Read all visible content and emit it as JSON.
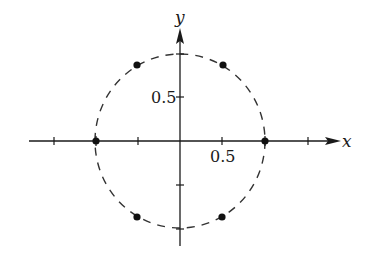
{
  "figure": {
    "type": "diagram",
    "axes": {
      "x_label": "x",
      "y_label": "y",
      "x_tick_label": "0.5",
      "y_tick_label": "0.5"
    },
    "circle": {
      "center": [
        0,
        0
      ],
      "radius": 1,
      "style": "dashed"
    },
    "points": [
      {
        "x": 1,
        "y": 0
      },
      {
        "x": 0.5,
        "y": 0.866
      },
      {
        "x": -0.5,
        "y": 0.866
      },
      {
        "x": -1,
        "y": 0
      },
      {
        "x": -0.5,
        "y": -0.866
      },
      {
        "x": 0.5,
        "y": -0.866
      }
    ],
    "colors": {
      "ink": "#1a1a1a",
      "circle": "#333333",
      "background": "#ffffff"
    }
  }
}
